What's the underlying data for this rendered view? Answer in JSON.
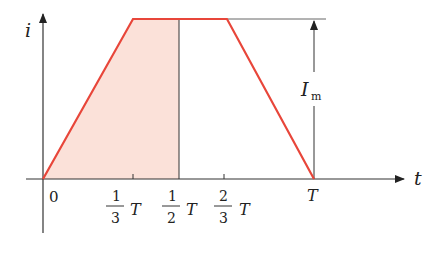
{
  "diagram": {
    "type": "trapezoidal current waveform",
    "axes": {
      "y_label": "i",
      "x_label": "t",
      "origin_label": "0"
    },
    "ticks": [
      {
        "num": "1",
        "den": "3",
        "sym": "T",
        "value": 0.3333
      },
      {
        "num": "1",
        "den": "2",
        "sym": "T",
        "value": 0.5
      },
      {
        "num": "2",
        "den": "3",
        "sym": "T",
        "value": 0.6667
      }
    ],
    "end_label": "T",
    "amplitude_label": "I",
    "amplitude_subscript": "m",
    "colors": {
      "waveform": "#e8463a",
      "fill": "#fbe1d9",
      "axis": "#333333"
    },
    "shaded_region": "area under i(t) from 0 to T/2"
  }
}
